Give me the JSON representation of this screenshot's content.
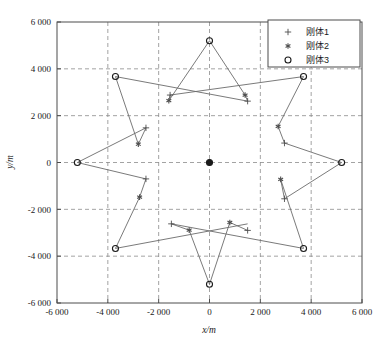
{
  "chart_data": {
    "type": "scatter",
    "title": "",
    "xlabel": "x/m",
    "ylabel": "y/m",
    "xlim": [
      -6000,
      6000
    ],
    "ylim": [
      -6000,
      6000
    ],
    "xticks": [
      -6000,
      -4000,
      -2000,
      0,
      2000,
      4000,
      6000
    ],
    "yticks": [
      -6000,
      -4000,
      -2000,
      0,
      2000,
      4000,
      6000
    ],
    "xtick_labels": [
      "-6 000",
      "-4 000",
      "-2 000",
      "0",
      "2 000",
      "4 000",
      "6 000"
    ],
    "ytick_labels": [
      "-6 000",
      "-4 000",
      "-2 000",
      "0",
      "2 000",
      "4 000",
      "6 000"
    ],
    "grid": true,
    "grid_style": "dashed",
    "legend_position": "top-right",
    "legend": [
      "刚体1",
      "刚体2",
      "刚体3"
    ],
    "markers": [
      "plus",
      "asterisk",
      "circle"
    ],
    "series": [
      {
        "name": "刚体1",
        "marker": "plus",
        "points": [
          [
            -1550,
            2880
          ],
          [
            -2500,
            1480
          ],
          [
            -2500,
            -700
          ],
          [
            -1500,
            -2620
          ],
          [
            1500,
            -2900
          ],
          [
            2950,
            -1550
          ],
          [
            2950,
            830
          ],
          [
            1500,
            2620
          ]
        ]
      },
      {
        "name": "刚体2",
        "marker": "asterisk",
        "points": [
          [
            -1600,
            2640
          ],
          [
            -2800,
            780
          ],
          [
            -2750,
            -1480
          ],
          [
            -800,
            -2890
          ],
          [
            800,
            -2560
          ],
          [
            2800,
            -720
          ],
          [
            2700,
            1540
          ],
          [
            1400,
            2880
          ]
        ]
      },
      {
        "name": "刚体3",
        "marker": "circle",
        "points": [
          [
            0,
            5200
          ],
          [
            3700,
            3670
          ],
          [
            5200,
            0
          ],
          [
            3700,
            -3670
          ],
          [
            0,
            -5200
          ],
          [
            -3700,
            -3670
          ],
          [
            -5200,
            0
          ],
          [
            -3700,
            3670
          ],
          [
            0,
            0
          ]
        ]
      }
    ],
    "segments": [
      [
        [
          0,
          5200
        ],
        [
          -1600,
          2640
        ]
      ],
      [
        [
          0,
          5200
        ],
        [
          1400,
          2880
        ]
      ],
      [
        [
          -3700,
          3670
        ],
        [
          1500,
          2620
        ]
      ],
      [
        [
          3700,
          3670
        ],
        [
          -1550,
          2880
        ]
      ],
      [
        [
          -3700,
          3670
        ],
        [
          -2800,
          780
        ]
      ],
      [
        [
          3700,
          3670
        ],
        [
          2700,
          1540
        ]
      ],
      [
        [
          -5200,
          0
        ],
        [
          -2500,
          1480
        ]
      ],
      [
        [
          -5200,
          0
        ],
        [
          -2500,
          -700
        ]
      ],
      [
        [
          5200,
          0
        ],
        [
          2950,
          830
        ]
      ],
      [
        [
          5200,
          0
        ],
        [
          2950,
          -1550
        ]
      ],
      [
        [
          -3700,
          -3670
        ],
        [
          -2750,
          -1480
        ]
      ],
      [
        [
          3700,
          -3670
        ],
        [
          2800,
          -720
        ]
      ],
      [
        [
          -3700,
          -3670
        ],
        [
          1500,
          -2620
        ]
      ],
      [
        [
          3700,
          -3670
        ],
        [
          -1500,
          -2620
        ]
      ],
      [
        [
          0,
          -5200
        ],
        [
          -800,
          -2890
        ]
      ],
      [
        [
          0,
          -5200
        ],
        [
          800,
          -2560
        ]
      ],
      [
        [
          -1550,
          2880
        ],
        [
          -1600,
          2640
        ]
      ],
      [
        [
          1400,
          2880
        ],
        [
          1500,
          2620
        ]
      ],
      [
        [
          -2500,
          1480
        ],
        [
          -2800,
          780
        ]
      ],
      [
        [
          2700,
          1540
        ],
        [
          2950,
          830
        ]
      ],
      [
        [
          -2500,
          -700
        ],
        [
          -2750,
          -1480
        ]
      ],
      [
        [
          2800,
          -720
        ],
        [
          2950,
          -1550
        ]
      ],
      [
        [
          -1500,
          -2620
        ],
        [
          -800,
          -2890
        ]
      ],
      [
        [
          800,
          -2560
        ],
        [
          1500,
          -2900
        ]
      ]
    ]
  },
  "legend": {
    "entries": [
      {
        "label": "刚体1",
        "marker": "plus"
      },
      {
        "label": "刚体2",
        "marker": "asterisk"
      },
      {
        "label": "刚体3",
        "marker": "circle"
      }
    ]
  },
  "axes": {
    "x_title": "x/m",
    "y_title": "y/m"
  },
  "colors": {
    "line": "#6b6b6b",
    "marker": "#4d4d4d",
    "axis": "#4d4d4d",
    "grid": "#8c8c8c",
    "text": "#1a1a1a",
    "background": "#ffffff"
  }
}
